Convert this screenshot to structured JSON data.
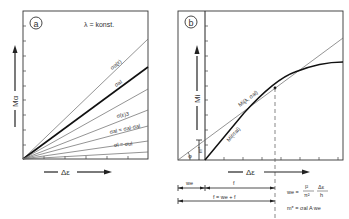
{
  "panel_a": {
    "badge": "a",
    "note": "λ = konst.",
    "y_label": "Mα",
    "x_label": "Δε",
    "curves": [
      {
        "label": "σα(ε)",
        "bold": false
      },
      {
        "label": "σal",
        "bold": true
      },
      {
        "label": "σ(ε)3",
        "bold": false
      },
      {
        "label": "σal = σal·σal",
        "bold": false
      },
      {
        "label": "σl = σul",
        "bold": false
      }
    ]
  },
  "panel_b": {
    "badge": "b",
    "y_label": "Mi",
    "x_label": "Δε",
    "curve_tangent_label": "Mi(λ, σal)",
    "curve_lower_label": "Mi(σal)",
    "angle_label": "φ",
    "offset_label": "m*",
    "dim_we": "we",
    "dim_f": "f",
    "dim_total": "f = we + f",
    "formula_we_lhs": "we =",
    "formula_we_num": "l²",
    "formula_we_den": "π²",
    "formula_frac_num": "Δε",
    "formula_frac_den": "h",
    "formula_m": "m* = σal A we"
  }
}
